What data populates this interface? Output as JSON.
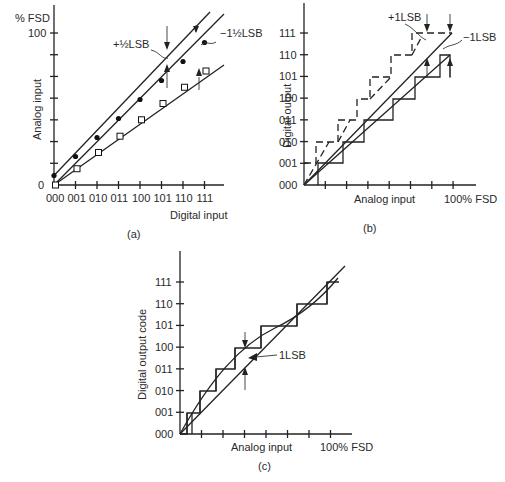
{
  "panels": {
    "a": {
      "caption": "(a)",
      "y_unit": "% FSD",
      "y_top_label": "100",
      "y_zero_label": "0",
      "ylabel": "Analog input",
      "xlabel": "Digital input",
      "x_ticks": [
        "000",
        "001",
        "010",
        "011",
        "100",
        "101",
        "110",
        "111"
      ],
      "annot_plus": "+½LSB",
      "annot_minus": "−1½LSB"
    },
    "b": {
      "caption": "(b)",
      "ylabel": "Digital output",
      "xlabel": "Analog input",
      "x_end_label": "100%  FSD",
      "y_ticks": [
        "000",
        "001",
        "010",
        "011",
        "100",
        "101",
        "110",
        "111"
      ],
      "annot_plus": "+1LSB",
      "annot_minus": "−1LSB"
    },
    "c": {
      "caption": "(c)",
      "ylabel": "Digital output code",
      "xlabel": "Analog input",
      "x_end_label": "100%  FSD",
      "y_ticks": [
        "000",
        "001",
        "010",
        "011",
        "100",
        "101",
        "110",
        "111"
      ],
      "annot": "1LSB"
    }
  },
  "chart_data": [
    {
      "type": "line",
      "title": "(a) DAC offset / gain error",
      "xlabel": "Digital input",
      "ylabel": "Analog input (% FSD)",
      "categories": [
        "000",
        "001",
        "010",
        "011",
        "100",
        "101",
        "110",
        "111"
      ],
      "ylim": [
        0,
        100
      ],
      "series": [
        {
          "name": "+1/2 LSB offset",
          "marker": "filled-circle",
          "values": [
            6.25,
            18.75,
            31.25,
            43.75,
            56.25,
            68.75,
            81.25,
            93.75
          ]
        },
        {
          "name": "ideal",
          "marker": "none",
          "values": [
            0,
            12.5,
            25,
            37.5,
            50,
            62.5,
            75,
            87.5
          ]
        },
        {
          "name": "-1 1/2 LSB gain",
          "marker": "open-square",
          "values": [
            0,
            10.7,
            21.4,
            32.1,
            42.9,
            53.6,
            64.3,
            75
          ]
        }
      ]
    },
    {
      "type": "line",
      "title": "(b) ADC offset error",
      "xlabel": "Analog input",
      "ylabel": "Digital output",
      "x_end_label": "100% FSD",
      "y_codes": [
        "000",
        "001",
        "010",
        "011",
        "100",
        "101",
        "110",
        "111"
      ],
      "series": [
        {
          "name": "+1LSB (dashed staircase)",
          "style": "dashed"
        },
        {
          "name": "ideal",
          "style": "solid-line"
        },
        {
          "name": "-1LSB (solid staircase)",
          "style": "solid"
        }
      ]
    },
    {
      "type": "line",
      "title": "(c) ADC non-linearity",
      "xlabel": "Analog input",
      "ylabel": "Digital output code",
      "x_end_label": "100% FSD",
      "y_codes": [
        "000",
        "001",
        "010",
        "011",
        "100",
        "101",
        "110",
        "111"
      ],
      "annotation": "1LSB"
    }
  ]
}
